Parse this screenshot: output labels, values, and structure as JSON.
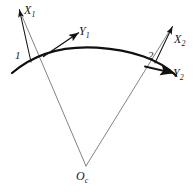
{
  "figure": {
    "background_color": "#ffffff",
    "line_color": "#1a1a1a",
    "radial_line_color": "#4a4a4a",
    "curve_color": "#111111",
    "width": 194,
    "height": 194
  },
  "labels": {
    "axis_x1": {
      "base": "X",
      "sub": "1"
    },
    "axis_y1": {
      "base": "Y",
      "sub": "1"
    },
    "axis_x2": {
      "base": "X",
      "sub": "2"
    },
    "axis_y2": {
      "base": "Y",
      "sub": "2"
    },
    "point_1": {
      "base": "1",
      "sub": ""
    },
    "point_2": {
      "base": "2",
      "sub": ""
    },
    "center_o": {
      "base": "O",
      "sub": "c"
    }
  },
  "geometry": {
    "curve": {
      "type": "arc",
      "start": [
        12,
        73
      ],
      "apex": [
        97,
        48
      ],
      "end": [
        176,
        75
      ],
      "description": "Convex-up circular arc representing the curve alignment"
    },
    "center_point": [
      86,
      166
    ],
    "station_1": [
      31,
      62
    ],
    "station_2": [
      155,
      63
    ],
    "radial_1": {
      "from": [
        86,
        166
      ],
      "to": [
        20,
        10
      ]
    },
    "radial_2": {
      "from": [
        86,
        166
      ],
      "to": [
        172,
        26
      ]
    },
    "axis_x1_arrow": {
      "from": [
        31,
        62
      ],
      "to": [
        19,
        9
      ]
    },
    "axis_y1_arrow": {
      "from": [
        47,
        58
      ],
      "to": [
        79,
        33
      ]
    },
    "axis_x2_arrow": {
      "from": [
        155,
        63
      ],
      "to": [
        173,
        26
      ]
    },
    "axis_y2_arrow": {
      "from": [
        146,
        68
      ],
      "to": [
        173,
        73
      ]
    }
  }
}
